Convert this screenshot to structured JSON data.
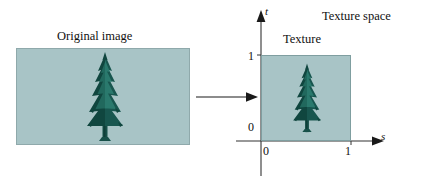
{
  "figure": {
    "type": "diagram",
    "background_color": "#ffffff"
  },
  "original_panel": {
    "title": "Original image",
    "fill_color": "#a8c4c6",
    "border_color": "#8fa9ab",
    "content_icon": "pine-tree-icon"
  },
  "transfer": {
    "icon": "right-arrow-icon",
    "color": "#1a1a1a"
  },
  "texture_space": {
    "title": "Texture space",
    "texture_label": "Texture",
    "fill_color": "#a8c4c6",
    "border_color": "#7f9ea0",
    "content_icon": "pine-tree-icon",
    "axes": {
      "horizontal": {
        "name": "s",
        "ticks": [
          "0",
          "1"
        ]
      },
      "vertical": {
        "name": "t",
        "ticks": [
          "0",
          "1"
        ]
      },
      "color": "#333333"
    }
  },
  "colors": {
    "teal_background": "#a8c4c6",
    "tree_dark": "#10463f",
    "tree_mid": "#18564f",
    "tree_light": "#2e7f72",
    "trunk": "#175049",
    "ink": "#1a1a1a"
  }
}
